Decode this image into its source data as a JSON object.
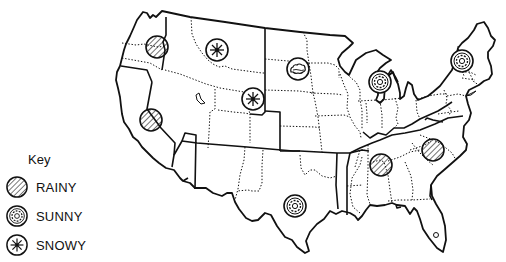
{
  "map": {
    "subject": "Weather map of the United States",
    "stroke_color": "#111111",
    "background": "#ffffff"
  },
  "key": {
    "title": "Key",
    "items": [
      {
        "label": "RAINY",
        "icon": "rainy-icon"
      },
      {
        "label": "SUNNY",
        "icon": "sunny-icon"
      },
      {
        "label": "SNOWY",
        "icon": "snowy-icon"
      },
      {
        "label": "CLOUDY",
        "icon": "cloudy-icon"
      }
    ]
  },
  "markers": [
    {
      "region": "Oregon",
      "weather": "RAINY",
      "x": 157,
      "y": 47
    },
    {
      "region": "Nevada/California",
      "weather": "RAINY",
      "x": 151,
      "y": 120
    },
    {
      "region": "Montana",
      "weather": "SNOWY",
      "x": 217,
      "y": 50
    },
    {
      "region": "Wyoming",
      "weather": "SNOWY",
      "x": 253,
      "y": 99
    },
    {
      "region": "North Dakota",
      "weather": "CLOUDY",
      "x": 298,
      "y": 69
    },
    {
      "region": "Wisconsin",
      "weather": "SUNNY",
      "x": 380,
      "y": 82
    },
    {
      "region": "Vermont",
      "weather": "SUNNY",
      "x": 462,
      "y": 61
    },
    {
      "region": "Texas",
      "weather": "SUNNY",
      "x": 295,
      "y": 206
    },
    {
      "region": "Alabama",
      "weather": "RAINY",
      "x": 381,
      "y": 165
    },
    {
      "region": "North Carolina",
      "weather": "RAINY",
      "x": 433,
      "y": 150
    }
  ]
}
